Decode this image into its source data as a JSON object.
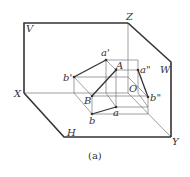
{
  "diagram": {
    "type": "three-plane projection (V, H, W) of line segment AB",
    "labels": {
      "V": "V",
      "H": "H",
      "W": "W",
      "X": "X",
      "Y": "Y",
      "Z": "Z",
      "O": "O",
      "A": "A",
      "B": "B",
      "a_front": "a'",
      "b_front": "b'",
      "a_top": "a",
      "b_top": "b",
      "a_side": "a\"",
      "b_side": "b\""
    },
    "caption": "(a)",
    "colors": {
      "line": "#333333",
      "construction": "#777777",
      "background": "#ffffff"
    }
  }
}
